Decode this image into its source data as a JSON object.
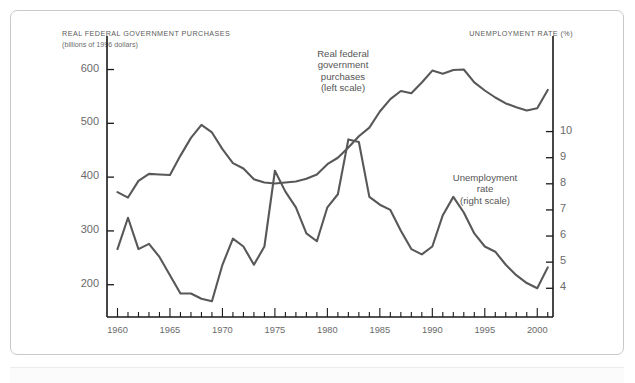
{
  "figure": {
    "left_axis_title": "REAL FEDERAL GOVERNMENT PURCHASES",
    "left_axis_subtitle": "(billions of 1996 dollars)",
    "right_axis_title": "UNEMPLOYMENT RATE (%)",
    "annotation_left": "Real federal\ngovernment\npurchases\n(left scale)",
    "annotation_right": "Unemployment\nrate\n(right scale)",
    "line_color": "#585858",
    "axis_color": "#1a1a1a",
    "text_color": "#6a6a6a",
    "frame_color": "#c9c9c9"
  },
  "chart_data": {
    "type": "line",
    "title": "",
    "xlabel": "",
    "ylabel": "REAL FEDERAL GOVERNMENT PURCHASES (billions of 1996 dollars)",
    "y2label": "UNEMPLOYMENT RATE (%)",
    "grid": false,
    "legend": "inline-annotations",
    "xlim": [
      1959,
      2001.5
    ],
    "xticks": [
      1960,
      1965,
      1970,
      1975,
      1980,
      1985,
      1990,
      1995,
      2000
    ],
    "xtick_labels": [
      "1960",
      "1965",
      "1970",
      "1975",
      "1980",
      "1985",
      "1990",
      "1995",
      "2000"
    ],
    "xminor_step": 1,
    "ylim": [
      140,
      640
    ],
    "yticks": [
      200,
      300,
      400,
      500,
      600
    ],
    "ytick_labels": [
      "200",
      "300",
      "400",
      "500",
      "600"
    ],
    "y2lim": [
      2.9,
      13.2
    ],
    "y2ticks": [
      4,
      5,
      6,
      7,
      8,
      9,
      10
    ],
    "y2tick_labels": [
      "4",
      "5",
      "6",
      "7",
      "8",
      "9",
      "10"
    ],
    "x": [
      1960,
      1961,
      1962,
      1963,
      1964,
      1965,
      1966,
      1967,
      1968,
      1969,
      1970,
      1971,
      1972,
      1973,
      1974,
      1975,
      1976,
      1977,
      1978,
      1979,
      1980,
      1981,
      1982,
      1983,
      1984,
      1985,
      1986,
      1987,
      1988,
      1989,
      1990,
      1991,
      1992,
      1993,
      1994,
      1995,
      1996,
      1997,
      1998,
      1999,
      2000,
      2001
    ],
    "series": [
      {
        "name": "Real federal government purchases",
        "axis": "left",
        "units": "billions of 1996 dollars",
        "values": [
          372,
          362,
          393,
          406,
          405,
          404,
          440,
          473,
          497,
          483,
          452,
          426,
          416,
          396,
          390,
          388,
          390,
          392,
          397,
          405,
          424,
          436,
          455,
          476,
          492,
          522,
          545,
          560,
          556,
          576,
          598,
          592,
          599,
          600,
          576,
          561,
          548,
          537,
          530,
          524,
          528,
          562
        ]
      },
      {
        "name": "Unemployment rate",
        "axis": "right",
        "units": "%",
        "values": [
          5.5,
          6.7,
          5.5,
          5.7,
          5.2,
          4.5,
          3.8,
          3.8,
          3.6,
          3.5,
          4.9,
          5.9,
          5.6,
          4.9,
          5.6,
          8.5,
          7.7,
          7.1,
          6.1,
          5.8,
          7.1,
          7.6,
          9.7,
          9.6,
          7.5,
          7.2,
          7.0,
          6.2,
          5.5,
          5.3,
          5.6,
          6.8,
          7.5,
          6.9,
          6.1,
          5.6,
          5.4,
          4.9,
          4.5,
          4.2,
          4.0,
          4.8
        ]
      }
    ]
  }
}
